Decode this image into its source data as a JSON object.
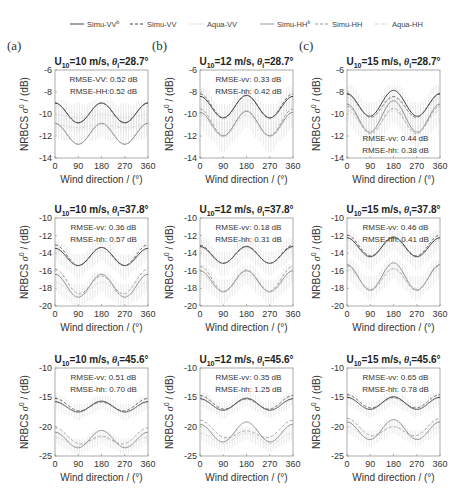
{
  "legend": [
    {
      "label": "Simu-VV",
      "sup": "b",
      "style": "solid",
      "color": "#444444"
    },
    {
      "label": "Simu-VV",
      "sup": "",
      "style": "dashed",
      "color": "#444444"
    },
    {
      "label": "Aqua-VV",
      "sup": "",
      "style": "dotted",
      "color": "#bbbbbb"
    },
    {
      "label": "Simu-HH",
      "sup": "b",
      "style": "solid",
      "color": "#999999"
    },
    {
      "label": "Simu-HH",
      "sup": "",
      "style": "dashed",
      "color": "#999999"
    },
    {
      "label": "Aqua-HH",
      "sup": "",
      "style": "dashdot",
      "color": "#cccccc"
    }
  ],
  "column_letters": [
    "(a)",
    "(b)",
    "(c)"
  ],
  "xlabel": "Wind direction / (°)",
  "ylabel": "NRBCS σ⁰ / (dB)",
  "chart_data": [
    {
      "type": "line",
      "panel": "a1",
      "title": "U10=10 m/s, θi=28.7°",
      "wind_speed": 10,
      "incidence": 28.7,
      "x": [
        0,
        90,
        180,
        270,
        360
      ],
      "ylim": [
        -14,
        -6
      ],
      "yticks": [
        -6,
        -8,
        -10,
        -12,
        -14
      ],
      "rmse": [
        "RMSE-VV: 0.52 dB",
        "RMSE-HH:0.52 dB"
      ],
      "rmse_pos": "top",
      "series": [
        {
          "name": "Simu-VV b",
          "mean": -9.9,
          "amp": 0.9,
          "upwind_skew": 0.0
        },
        {
          "name": "Simu-VV",
          "mean": -9.9,
          "amp": 0.9,
          "upwind_skew": 0.0
        },
        {
          "name": "Aqua-VV",
          "mean": -10.2,
          "amp": 0.15,
          "upwind_skew": 0.0
        },
        {
          "name": "Simu-HH b",
          "mean": -11.8,
          "amp": 0.95,
          "upwind_skew": 0.0
        },
        {
          "name": "Simu-HH",
          "mean": -11.8,
          "amp": 0.95,
          "upwind_skew": 0.0
        },
        {
          "name": "Aqua-HH",
          "mean": -11.1,
          "amp": 0.15,
          "upwind_skew": 0.0
        }
      ]
    },
    {
      "type": "line",
      "panel": "b1",
      "title": "U10=12 m/s, θi=28.7°",
      "wind_speed": 12,
      "incidence": 28.7,
      "x": [
        0,
        90,
        180,
        270,
        360
      ],
      "ylim": [
        -14,
        -6
      ],
      "yticks": [
        -6,
        -8,
        -10,
        -12,
        -14
      ],
      "rmse": [
        "RMSE-vv: 0.33 dB",
        "RMSE-hh: 0.42 dB"
      ],
      "rmse_pos": "top",
      "series": [
        {
          "name": "Simu-VV b",
          "mean": -9.35,
          "amp": 1.0,
          "upwind_skew": 0.1
        },
        {
          "name": "Simu-VV",
          "mean": -9.3,
          "amp": 1.05,
          "upwind_skew": 0.15
        },
        {
          "name": "Aqua-VV",
          "mean": -9.6,
          "amp": 0.9,
          "upwind_skew": 0.0
        },
        {
          "name": "Simu-HH b",
          "mean": -10.9,
          "amp": 1.1,
          "upwind_skew": 0.1
        },
        {
          "name": "Simu-HH",
          "mean": -10.8,
          "amp": 1.15,
          "upwind_skew": 0.2
        },
        {
          "name": "Aqua-HH",
          "mean": -11.1,
          "amp": 1.0,
          "upwind_skew": 0.0
        }
      ]
    },
    {
      "type": "line",
      "panel": "c1",
      "title": "U10=15 m/s, θi=28.7°",
      "wind_speed": 15,
      "incidence": 28.7,
      "x": [
        0,
        90,
        180,
        270,
        360
      ],
      "ylim": [
        -14,
        -6
      ],
      "yticks": [
        -6,
        -8,
        -10,
        -12,
        -14
      ],
      "rmse": [
        "RMSE-vv: 0.44 dB",
        "RMSE-hh: 0.38 dB"
      ],
      "rmse_pos": "bottom",
      "series": [
        {
          "name": "Simu-VV b",
          "mean": -9.1,
          "amp": 1.1,
          "upwind_skew": 0.3
        },
        {
          "name": "Simu-VV",
          "mean": -9.3,
          "amp": 1.0,
          "upwind_skew": 0.2
        },
        {
          "name": "Aqua-VV",
          "mean": -9.4,
          "amp": 0.9,
          "upwind_skew": 0.0
        },
        {
          "name": "Simu-HH b",
          "mean": -10.3,
          "amp": 1.35,
          "upwind_skew": 0.3
        },
        {
          "name": "Simu-HH",
          "mean": -10.6,
          "amp": 1.2,
          "upwind_skew": 0.2
        },
        {
          "name": "Aqua-HH",
          "mean": -10.7,
          "amp": 1.0,
          "upwind_skew": 0.0
        }
      ]
    },
    {
      "type": "line",
      "panel": "a2",
      "title": "U10=10 m/s, θi=37.8°",
      "wind_speed": 10,
      "incidence": 37.8,
      "x": [
        0,
        90,
        180,
        270,
        360
      ],
      "ylim": [
        -20,
        -10
      ],
      "yticks": [
        -10,
        -12,
        -14,
        -16,
        -18,
        -20
      ],
      "rmse": [
        "RMSE-vv: 0.36 dB",
        "RMSE-hh: 0.57 dB"
      ],
      "rmse_pos": "top",
      "series": [
        {
          "name": "Simu-VV b",
          "mean": -14.4,
          "amp": 1.0,
          "upwind_skew": 0.1
        },
        {
          "name": "Simu-VV",
          "mean": -14.3,
          "amp": 1.1,
          "upwind_skew": 0.3
        },
        {
          "name": "Aqua-VV",
          "mean": -14.6,
          "amp": 0.9,
          "upwind_skew": 0.0
        },
        {
          "name": "Simu-HH b",
          "mean": -17.7,
          "amp": 1.3,
          "upwind_skew": 0.0
        },
        {
          "name": "Simu-HH",
          "mean": -17.4,
          "amp": 1.2,
          "upwind_skew": 0.8
        },
        {
          "name": "Aqua-HH",
          "mean": -18.1,
          "amp": 0.8,
          "upwind_skew": 0.0
        }
      ]
    },
    {
      "type": "line",
      "panel": "b2",
      "title": "U10=12 m/s, θi=37.8°",
      "wind_speed": 12,
      "incidence": 37.8,
      "x": [
        0,
        90,
        180,
        270,
        360
      ],
      "ylim": [
        -20,
        -10
      ],
      "yticks": [
        -10,
        -12,
        -14,
        -16,
        -18,
        -20
      ],
      "rmse": [
        "RMSE-vv: 0.18 dB",
        "RMSE-hh: 0.31 dB"
      ],
      "rmse_pos": "top",
      "series": [
        {
          "name": "Simu-VV b",
          "mean": -14.2,
          "amp": 0.95,
          "upwind_skew": 0.0
        },
        {
          "name": "Simu-VV",
          "mean": -14.15,
          "amp": 1.0,
          "upwind_skew": 0.1
        },
        {
          "name": "Aqua-VV",
          "mean": -14.3,
          "amp": 0.9,
          "upwind_skew": 0.0
        },
        {
          "name": "Simu-HH b",
          "mean": -17.2,
          "amp": 1.2,
          "upwind_skew": 0.0
        },
        {
          "name": "Simu-HH",
          "mean": -17.0,
          "amp": 1.3,
          "upwind_skew": 0.4
        },
        {
          "name": "Aqua-HH",
          "mean": -17.4,
          "amp": 1.0,
          "upwind_skew": 0.0
        }
      ]
    },
    {
      "type": "line",
      "panel": "c2",
      "title": "U10=15 m/s, θi=37.8°",
      "wind_speed": 15,
      "incidence": 37.8,
      "x": [
        0,
        90,
        180,
        270,
        360
      ],
      "ylim": [
        -20,
        -10
      ],
      "yticks": [
        -10,
        -12,
        -14,
        -16,
        -18,
        -20
      ],
      "rmse": [
        "RMSE-vv: 0.46 dB",
        "RMSE-hh: 0.41 dB"
      ],
      "rmse_pos": "top",
      "series": [
        {
          "name": "Simu-VV b",
          "mean": -13.3,
          "amp": 1.1,
          "upwind_skew": 0.1
        },
        {
          "name": "Simu-VV",
          "mean": -13.2,
          "amp": 1.1,
          "upwind_skew": 0.3
        },
        {
          "name": "Aqua-VV",
          "mean": -13.5,
          "amp": 1.0,
          "upwind_skew": 0.0
        },
        {
          "name": "Simu-HH b",
          "mean": -16.7,
          "amp": 1.5,
          "upwind_skew": 0.2
        },
        {
          "name": "Simu-HH",
          "mean": -16.9,
          "amp": 1.3,
          "upwind_skew": 0.3
        },
        {
          "name": "Aqua-HH",
          "mean": -16.9,
          "amp": 1.1,
          "upwind_skew": 0.0
        }
      ]
    },
    {
      "type": "line",
      "panel": "a3",
      "title": "U10=10 m/s, θi=45.6°",
      "wind_speed": 10,
      "incidence": 45.6,
      "x": [
        0,
        90,
        180,
        270,
        360
      ],
      "ylim": [
        -25,
        -10
      ],
      "yticks": [
        -10,
        -15,
        -20,
        -25
      ],
      "rmse": [
        "RMSE-vv: 0.51 dB",
        "RMSE-hh: 0.70 dB"
      ],
      "rmse_pos": "top",
      "series": [
        {
          "name": "Simu-VV b",
          "mean": -16.6,
          "amp": 0.9,
          "upwind_skew": 0.1
        },
        {
          "name": "Simu-VV",
          "mean": -16.4,
          "amp": 0.9,
          "upwind_skew": 0.6
        },
        {
          "name": "Aqua-VV",
          "mean": -16.7,
          "amp": 0.8,
          "upwind_skew": 0.0
        },
        {
          "name": "Simu-HH b",
          "mean": -22.2,
          "amp": 1.4,
          "upwind_skew": 0.3
        },
        {
          "name": "Simu-HH",
          "mean": -21.9,
          "amp": 1.0,
          "upwind_skew": 1.4
        },
        {
          "name": "Aqua-HH",
          "mean": -22.6,
          "amp": 0.8,
          "upwind_skew": 0.0
        }
      ]
    },
    {
      "type": "line",
      "panel": "b3",
      "title": "U10=12 m/s, θi=45.6°",
      "wind_speed": 12,
      "incidence": 45.6,
      "x": [
        0,
        90,
        180,
        270,
        360
      ],
      "ylim": [
        -25,
        -10
      ],
      "yticks": [
        -10,
        -15,
        -20,
        -25
      ],
      "rmse": [
        "RMSE-vv: 0.35 dB",
        "RMSE-hh: 1.25 dB"
      ],
      "rmse_pos": "top",
      "series": [
        {
          "name": "Simu-VV b",
          "mean": -16.2,
          "amp": 1.0,
          "upwind_skew": 0.1
        },
        {
          "name": "Simu-VV",
          "mean": -16.0,
          "amp": 1.0,
          "upwind_skew": 0.6
        },
        {
          "name": "Aqua-VV",
          "mean": -16.3,
          "amp": 0.9,
          "upwind_skew": 0.0
        },
        {
          "name": "Simu-HH b",
          "mean": -21.0,
          "amp": 1.6,
          "upwind_skew": 0.4
        },
        {
          "name": "Simu-HH",
          "mean": -20.8,
          "amp": 1.0,
          "upwind_skew": 1.8
        },
        {
          "name": "Aqua-HH",
          "mean": -22.0,
          "amp": 0.9,
          "upwind_skew": 0.0
        }
      ]
    },
    {
      "type": "line",
      "panel": "c3",
      "title": "U10=15 m/s, θi=45.6°",
      "wind_speed": 15,
      "incidence": 45.6,
      "x": [
        0,
        90,
        180,
        270,
        360
      ],
      "ylim": [
        -25,
        -10
      ],
      "yticks": [
        -10,
        -15,
        -20,
        -25
      ],
      "rmse": [
        "RMSE-vv: 0.65 dB",
        "RMSE-hh: 0.78 dB"
      ],
      "rmse_pos": "top",
      "series": [
        {
          "name": "Simu-VV b",
          "mean": -16.0,
          "amp": 1.05,
          "upwind_skew": 0.1
        },
        {
          "name": "Simu-VV",
          "mean": -15.8,
          "amp": 1.0,
          "upwind_skew": 0.5
        },
        {
          "name": "Aqua-VV",
          "mean": -16.1,
          "amp": 0.9,
          "upwind_skew": 0.0
        },
        {
          "name": "Simu-HH b",
          "mean": -20.6,
          "amp": 1.6,
          "upwind_skew": 0.4
        },
        {
          "name": "Simu-HH",
          "mean": -20.4,
          "amp": 1.1,
          "upwind_skew": 1.4
        },
        {
          "name": "Aqua-HH",
          "mean": -21.0,
          "amp": 1.0,
          "upwind_skew": 0.0
        }
      ]
    }
  ]
}
